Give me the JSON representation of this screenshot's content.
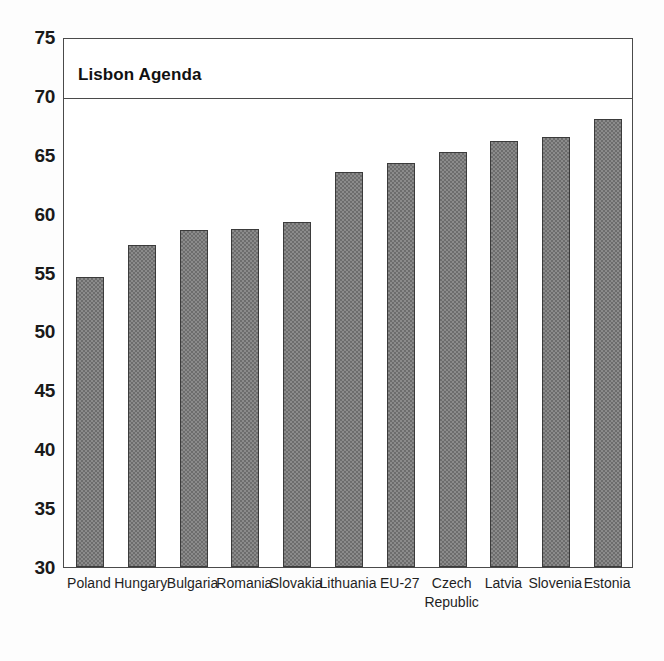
{
  "chart_data": {
    "type": "bar",
    "title": "",
    "subtitle": "",
    "xlabel": "",
    "ylabel": "",
    "ylim": [
      30,
      75
    ],
    "ytick_step": 5,
    "yticks": [
      30,
      35,
      40,
      45,
      50,
      55,
      60,
      65,
      70,
      75
    ],
    "ytick_labels": [
      "30",
      "35",
      "40",
      "45",
      "50",
      "55",
      "60",
      "65",
      "70",
      "75"
    ],
    "grid": false,
    "legend": "none",
    "categories": [
      "Poland",
      "Hungary",
      "Bulgaria",
      "Romania",
      "Slovakia",
      "Lithuania",
      "EU-27",
      "Czech\nRepublic",
      "Latvia",
      "Slovenia",
      "Estonia"
    ],
    "values": [
      54.6,
      57.3,
      58.6,
      58.7,
      59.3,
      63.5,
      64.3,
      65.2,
      66.2,
      66.5,
      68.0
    ],
    "annotations": [
      {
        "name": "lisbon-agenda-target",
        "label": "Lisbon Agenda",
        "value": 70.0,
        "type": "horizontal-reference-line"
      }
    ],
    "colors": {
      "bar_fill": "#8b8b8b",
      "bar_edge": "#3b3b3b",
      "axis": "#4a4a4a",
      "text": "#1a1a1a",
      "background": "#ffffff"
    }
  }
}
